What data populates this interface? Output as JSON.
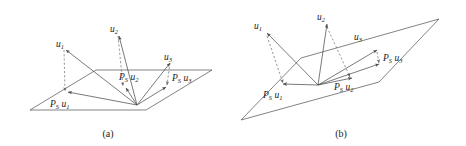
{
  "figure": {
    "kind": "geometry-diagram",
    "colors": {
      "background": "#ffffff",
      "line": "#4d4d4d",
      "dashed_line": "#6b6b6b",
      "text": "#1a1a1a"
    }
  },
  "panels": [
    {
      "id": "a",
      "caption": "(a)",
      "vectors": [
        {
          "name": "u1",
          "label_base": "u",
          "label_sub": "1",
          "label_x": 56,
          "label_y": 44,
          "tip": [
            64,
            48
          ],
          "origin": [
            137,
            105
          ]
        },
        {
          "name": "u2",
          "label_base": "u",
          "label_sub": "2",
          "label_x": 112,
          "label_y": 29,
          "tip": [
            118,
            33
          ],
          "origin": [
            137,
            105
          ]
        },
        {
          "name": "u3",
          "label_base": "u",
          "label_sub": "3",
          "label_x": 166,
          "label_y": 57,
          "tip": [
            171,
            61
          ],
          "origin": [
            137,
            105
          ]
        }
      ],
      "projections": [
        {
          "name": "Ps_u1",
          "label_base_p": "P",
          "label_sub_s": "S",
          "label_base_u": "u",
          "label_sub_u": "1",
          "label_x": 57,
          "label_y": 105,
          "tip": [
            66,
            93
          ],
          "origin": [
            137,
            105
          ]
        },
        {
          "name": "Ps_u2",
          "label_base_p": "P",
          "label_sub_s": "S",
          "label_base_u": "u",
          "label_sub_u": "2",
          "label_x": 125,
          "label_y": 78,
          "tip": [
            124,
            89
          ],
          "origin": [
            137,
            105
          ]
        },
        {
          "name": "Ps_u3",
          "label_base_p": "P",
          "label_sub_s": "S",
          "label_base_u": "u",
          "label_sub_u": "3",
          "label_x": 174,
          "label_y": 80,
          "tip": [
            168,
            88
          ],
          "origin": [
            137,
            105
          ]
        }
      ],
      "plane_points": "30,110 96,70 212,70 146,110",
      "origin_point": [
        137,
        105
      ]
    },
    {
      "id": "b",
      "caption": "(b)",
      "vectors": [
        {
          "name": "u1",
          "label_base": "u",
          "label_sub": "1",
          "label_x": 25,
          "label_y": 26,
          "tip": [
            33,
            33
          ],
          "origin": [
            85,
            85
          ]
        },
        {
          "name": "u2",
          "label_base": "u",
          "label_sub": "2",
          "label_x": 86,
          "label_y": 17,
          "tip": [
            93,
            24
          ],
          "origin": [
            85,
            85
          ]
        },
        {
          "name": "u3",
          "label_base": "u",
          "label_sub": "3",
          "label_x": 124,
          "label_y": 37,
          "tip": [
            143,
            50
          ],
          "origin": [
            85,
            85
          ]
        }
      ],
      "projections": [
        {
          "name": "Ps_u1",
          "label_base_p": "P",
          "label_sub_s": "S",
          "label_base_u": "u",
          "label_sub_u": "1",
          "label_x": 36,
          "label_y": 96,
          "tip": [
            52,
            85
          ],
          "origin": [
            85,
            85
          ]
        },
        {
          "name": "Ps_u2",
          "label_base_p": "P",
          "label_sub_s": "S",
          "label_base_u": "u",
          "label_sub_u": "2",
          "label_x": 106,
          "label_y": 88,
          "tip": [
            118,
            79
          ],
          "origin": [
            85,
            85
          ]
        },
        {
          "name": "Ps_u3",
          "label_base_p": "P",
          "label_sub_s": "S",
          "label_base_u": "u",
          "label_sub_u": "3",
          "label_x": 149,
          "label_y": 59,
          "tip": [
            146,
            64
          ],
          "origin": [
            85,
            85
          ]
        }
      ],
      "plane_points": "8,120 68,58 206,19 146,82",
      "origin_point": [
        85,
        85
      ]
    }
  ]
}
